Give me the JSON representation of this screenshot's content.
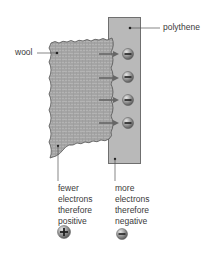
{
  "labels": {
    "wool": "wool",
    "polythene": "polythene"
  },
  "captions": {
    "wool_side": [
      "fewer",
      "electrons",
      "therefore",
      "positive"
    ],
    "polythene_side": [
      "more",
      "electrons",
      "therefore",
      "negative"
    ]
  },
  "charges": {
    "on_polythene": [
      "-",
      "-",
      "-",
      "-"
    ],
    "wool_symbol": "+",
    "polythene_symbol": "-"
  },
  "colors": {
    "polythene_fill": "#b9b9b9",
    "polythene_border": "#6f6f6f",
    "wool_fill": "#a9a9a9",
    "arrow": "#666666",
    "charge_ball": "#8a8a8a"
  }
}
